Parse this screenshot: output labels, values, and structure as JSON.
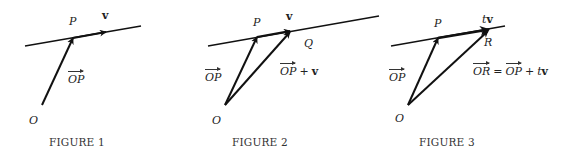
{
  "figures": [
    {
      "caption": "FIGURE 1",
      "labels": {
        "P": "P",
        "v": "v",
        "O": "O",
        "OP": "OP"
      },
      "geometry": {
        "line": {
          "x1": 25,
          "y1": 46,
          "x2": 141,
          "y2": 26
        },
        "O": {
          "x": 42,
          "y": 105
        },
        "P": {
          "x": 73,
          "y": 38
        },
        "v_tip": {
          "x": 106,
          "y": 32
        }
      }
    },
    {
      "caption": "FIGURE 2",
      "labels": {
        "P": "P",
        "v": "v",
        "Q": "Q",
        "O": "O",
        "OP": "OP",
        "OP_plus_v": {
          "vec": "OP",
          "op": "+",
          "term": "v"
        }
      },
      "geometry": {
        "line": {
          "x1": 208,
          "y1": 46,
          "x2": 379,
          "y2": 16
        },
        "O": {
          "x": 225,
          "y": 105
        },
        "P": {
          "x": 257,
          "y": 37
        },
        "Q": {
          "x": 290,
          "y": 31
        }
      }
    },
    {
      "caption": "FIGURE 3",
      "labels": {
        "P": "P",
        "tv": "tv",
        "t": "t",
        "v": "v",
        "R": "R",
        "O": "O",
        "OP": "OP",
        "equation": {
          "lhs": "OR",
          "eq": "=",
          "rhs_vec": "OP",
          "op": "+",
          "t": "t",
          "v": "v"
        }
      },
      "geometry": {
        "line": {
          "x1": 391,
          "y1": 46,
          "x2": 505,
          "y2": 26
        },
        "O": {
          "x": 408,
          "y": 105
        },
        "P": {
          "x": 438,
          "y": 38
        },
        "R": {
          "x": 488,
          "y": 30
        }
      }
    }
  ],
  "colors": {
    "ink": "#111111",
    "label": "#222222",
    "background": "#ffffff"
  }
}
